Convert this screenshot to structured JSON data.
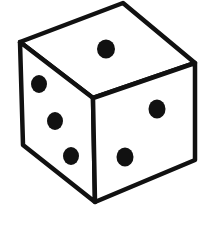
{
  "figure": {
    "colors": {
      "background": "#ffffff",
      "outline": "#111111",
      "pip": "#111111",
      "face": "#ffffff"
    },
    "faces": {
      "top": {
        "value": 1
      },
      "left": {
        "value": 3
      },
      "right": {
        "value": 2
      }
    }
  }
}
